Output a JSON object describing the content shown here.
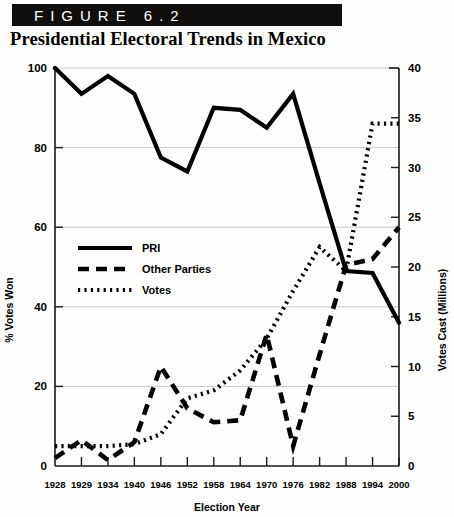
{
  "figure": {
    "banner_label": "FIGURE 6.2",
    "title": "Presidential Electoral Trends in Mexico"
  },
  "chart_data": {
    "type": "line",
    "title": "Presidential Electoral Trends in Mexico",
    "xlabel": "Election Year",
    "ylabel": "% Votes Won",
    "y2label": "Votes Cast (Millions)",
    "grid": true,
    "legend_position": "inside-upper-left",
    "x": [
      "1928",
      "1929",
      "1934",
      "1940",
      "1946",
      "1952",
      "1958",
      "1964",
      "1970",
      "1976",
      "1982",
      "1988",
      "1994",
      "2000"
    ],
    "ylim": [
      0,
      100
    ],
    "yticks": [
      0,
      20,
      40,
      60,
      80,
      100
    ],
    "y2lim": [
      0,
      40
    ],
    "y2ticks": [
      0,
      5,
      10,
      15,
      20,
      25,
      30,
      35,
      40
    ],
    "series": [
      {
        "name": "PRI",
        "axis": "left",
        "style": "solid",
        "unit": "% votes won",
        "values": [
          100,
          93.5,
          98,
          93.5,
          77.5,
          74,
          90,
          89.5,
          85,
          93.5,
          71,
          49,
          48.5,
          36
        ]
      },
      {
        "name": "Other Parties",
        "axis": "left",
        "style": "dashed",
        "unit": "% votes won",
        "values": [
          2,
          6.5,
          1.5,
          6,
          25,
          14.5,
          11,
          11.5,
          33,
          5,
          28,
          50.5,
          52,
          60
        ]
      },
      {
        "name": "Votes",
        "axis": "right",
        "style": "dotted",
        "unit": "millions of votes cast",
        "values_percent_scale": [
          5,
          5,
          5,
          5.5,
          8,
          17,
          19,
          24,
          32,
          44,
          55,
          49,
          86,
          86
        ],
        "values_millions": [
          2,
          2,
          2,
          2.2,
          3.2,
          6.8,
          7.6,
          9.6,
          12.8,
          17.6,
          22,
          19.6,
          34.4,
          34.4
        ]
      }
    ],
    "legend": [
      "PRI",
      "Other Parties",
      "Votes"
    ]
  }
}
